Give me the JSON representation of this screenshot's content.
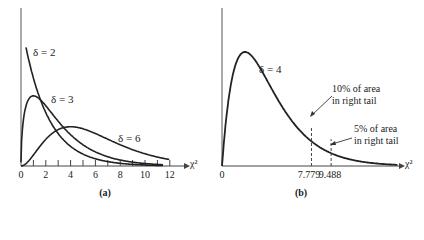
{
  "chart_data": [
    {
      "type": "line",
      "panel": "(a)",
      "title": "",
      "xlabel": "χ²",
      "ylabel": "",
      "xlim": [
        0,
        12
      ],
      "x_ticks": [
        "0",
        "2",
        "4",
        "6",
        "8",
        "10",
        "12"
      ],
      "series": [
        {
          "name": "δ = 2",
          "df": 2
        },
        {
          "name": "δ = 3",
          "df": 3
        },
        {
          "name": "δ = 6",
          "df": 6
        }
      ],
      "grid": false,
      "legend": "inline labels"
    },
    {
      "type": "line",
      "panel": "(b)",
      "xlabel": "χ²",
      "x_ticks": [
        "0",
        "7.779",
        "9.488"
      ],
      "series": [
        {
          "name": "δ = 4",
          "df": 4
        }
      ],
      "annotations": [
        {
          "text": "10% of area in right tail",
          "x": 7.779
        },
        {
          "text": "5% of area in right tail",
          "x": 9.488
        }
      ],
      "grid": false
    }
  ],
  "a": {
    "caption": "(a)",
    "axis_label": "χ²",
    "ticks": [
      "0",
      "2",
      "4",
      "6",
      "8",
      "10",
      "12"
    ],
    "labels": {
      "d2": "δ = 2",
      "d3": "δ = 3",
      "d6": "δ = 6"
    }
  },
  "b": {
    "caption": "(b)",
    "axis_label": "χ²",
    "origin": "0",
    "crit10": "7.779",
    "crit5": "9.488",
    "label_d4": "δ = 4",
    "ann10_l1": "10% of area",
    "ann10_l2": "in right tail",
    "ann5_l1": "5% of area",
    "ann5_l2": "in right tail"
  }
}
